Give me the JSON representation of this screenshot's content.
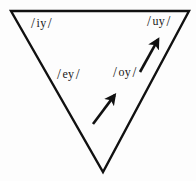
{
  "diagram": {
    "kind": "inverted-triangle-vowel-diagram",
    "background_color": "#fdfdfd",
    "stroke_color": "#111111",
    "text_color": "#1a1a1a",
    "canvas": {
      "width": 196,
      "height": 181
    },
    "triangle": {
      "name": "vowel-triangle",
      "vertices": [
        {
          "name": "top-left",
          "x": 11,
          "y": 11
        },
        {
          "name": "top-right",
          "x": 189,
          "y": 11
        },
        {
          "name": "bottom",
          "x": 103,
          "y": 172
        }
      ],
      "stroke_width": 2.4
    },
    "labels": [
      {
        "id": "iy",
        "text": "/ iy /",
        "open": "/",
        "vowel": "iy",
        "close": "/",
        "x": 31,
        "y": 16
      },
      {
        "id": "uy",
        "text": "/ uy /",
        "open": "/",
        "vowel": "uy",
        "close": "/",
        "x": 147,
        "y": 14
      },
      {
        "id": "ey",
        "text": "/ ey /",
        "open": "/",
        "vowel": "ey",
        "close": "/",
        "x": 57,
        "y": 67
      },
      {
        "id": "oy",
        "text": "/ oy /",
        "open": "/",
        "vowel": "oy",
        "close": "/",
        "x": 113,
        "y": 65
      }
    ],
    "arrows": [
      {
        "id": "arrow-lower",
        "name": "shift-arrow-oy-to-uy-lower",
        "from": {
          "x": 93,
          "y": 124
        },
        "to": {
          "x": 117,
          "y": 92
        },
        "direction": "up-right",
        "stroke_width": 2.6
      },
      {
        "id": "arrow-upper",
        "name": "shift-arrow-toward-uy",
        "from": {
          "x": 140,
          "y": 72
        },
        "to": {
          "x": 160,
          "y": 36
        },
        "direction": "up-right",
        "stroke_width": 2.6
      }
    ]
  }
}
